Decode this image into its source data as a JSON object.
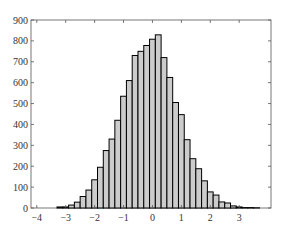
{
  "chart_data": {
    "type": "bar",
    "subtype": "histogram",
    "title": "",
    "xlabel": "",
    "ylabel": "",
    "xlim": [
      -4.2,
      4.1
    ],
    "ylim": [
      0,
      900
    ],
    "x_ticks": [
      -4,
      -3,
      -2,
      -1,
      0,
      1,
      2,
      3
    ],
    "y_ticks": [
      0,
      100,
      200,
      300,
      400,
      500,
      600,
      700,
      800,
      900
    ],
    "grid": false,
    "legend": null,
    "bin_width": 0.2,
    "bin_edges_start": -3.3,
    "values": [
      5,
      5,
      14,
      28,
      55,
      86,
      135,
      195,
      275,
      330,
      420,
      535,
      610,
      730,
      750,
      778,
      808,
      829,
      720,
      625,
      505,
      447,
      327,
      236,
      188,
      130,
      77,
      62,
      29,
      24,
      10,
      5,
      2,
      2,
      1
    ],
    "bar_fill": "#cccccc",
    "bar_edge": "#000000"
  }
}
